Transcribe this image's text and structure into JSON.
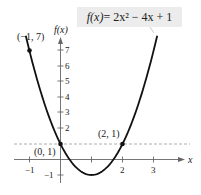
{
  "chart_data": {
    "type": "line",
    "title": "f(x) = 2x² − 4x + 1",
    "function": "2x^2 - 4x + 1",
    "xlabel": "x",
    "ylabel": "f(x)",
    "xlim": [
      -1.4,
      3.9
    ],
    "ylim": [
      -1.3,
      7.8
    ],
    "x_ticks": [
      -1,
      1,
      2,
      3
    ],
    "x_tick_labels": [
      "−1",
      "",
      "2",
      "3"
    ],
    "y_ticks": [
      -1,
      1,
      2,
      3,
      4,
      5,
      6,
      7
    ],
    "y_tick_labels": [
      "−1",
      "",
      "2",
      "3",
      "4",
      "5",
      "6",
      "7"
    ],
    "grid": false,
    "series": [
      {
        "name": "f(x) = 2x² − 4x + 1",
        "x": [
          -1,
          -0.5,
          0,
          0.5,
          1,
          1.5,
          2,
          2.5,
          3
        ],
        "y": [
          7,
          3.5,
          1,
          -0.5,
          -1,
          -0.5,
          1,
          3.5,
          7
        ]
      }
    ],
    "points": [
      {
        "x": -1,
        "y": 7,
        "label": "(−1, 7)"
      },
      {
        "x": 0,
        "y": 1,
        "label": "(0, 1)"
      },
      {
        "x": 2,
        "y": 1,
        "label": "(2, 1)"
      }
    ],
    "reference_lines": [
      {
        "type": "horizontal",
        "y": 1,
        "style": "dashed"
      }
    ]
  },
  "equation": {
    "lhs": "f(x)",
    "rhs": " = 2x² − 4x + 1"
  },
  "axes": {
    "x_label": "x",
    "y_label": "f(x)",
    "x_tick_labels": [
      "−1",
      "2",
      "3"
    ],
    "y_tick_labels": [
      "7",
      "6",
      "5",
      "4",
      "3",
      "2",
      "−1"
    ]
  },
  "annotations": {
    "p1": "(−1, 7)",
    "p2": "(0, 1)",
    "p3": "(2, 1)"
  }
}
